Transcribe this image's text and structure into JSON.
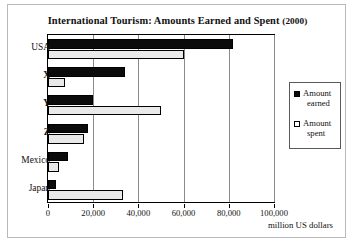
{
  "chart": {
    "title_main": "International Tourism: Amounts Earned and Spent",
    "title_year": "(2000)",
    "axis_label": "million US  dollars"
  },
  "legend": {
    "items": [
      {
        "name": "amount-earned",
        "line1": "Amount",
        "line2": "earned",
        "swatch": "filled",
        "color": "#0b0b0b"
      },
      {
        "name": "amount-spent",
        "line1": "Amount",
        "line2": "spent",
        "swatch": "hollow",
        "color": "#e9e9e9"
      }
    ]
  },
  "chart_data": {
    "type": "bar",
    "orientation": "horizontal",
    "title": "International Tourism: Amounts Earned and Spent (2000)",
    "xlabel": "million US dollars",
    "ylabel": "",
    "categories": [
      "USA",
      "X",
      "Y",
      "Z",
      "Mexico",
      "Japan"
    ],
    "series": [
      {
        "name": "Amount earned",
        "values": [
          82000,
          34000,
          20000,
          17500,
          9000,
          3500
        ]
      },
      {
        "name": "Amount spent",
        "values": [
          60000,
          7500,
          50000,
          16000,
          5000,
          33000
        ]
      }
    ],
    "xlim": [
      0,
      100000
    ],
    "xticks": [
      0,
      20000,
      40000,
      60000,
      80000,
      100000
    ],
    "xtick_labels": [
      "0",
      "20,000",
      "40,000",
      "60,000",
      "80,000",
      "100,000"
    ],
    "grid": true,
    "legend_position": "right"
  }
}
